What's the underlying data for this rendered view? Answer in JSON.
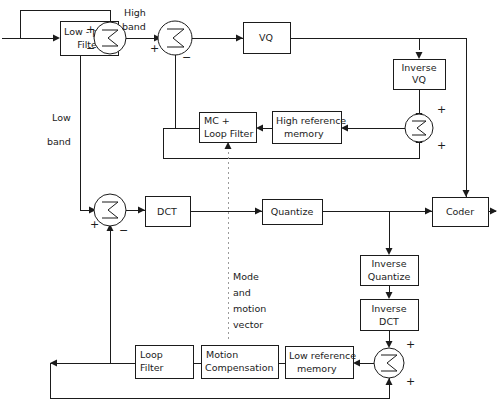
{
  "diagram": {
    "stroke_color": "#1b1b1b",
    "dotted_color": "#9a9a9a",
    "background": "#ffffff",
    "blocks": [
      {
        "id": "low-pass-filter",
        "lines": [
          "Low - pass",
          "Filter"
        ]
      },
      {
        "id": "vq",
        "lines": [
          "VQ"
        ]
      },
      {
        "id": "inverse-vq",
        "lines": [
          "Inverse",
          "VQ"
        ]
      },
      {
        "id": "mc-loop-filter",
        "lines": [
          "MC +",
          "Loop Filter"
        ]
      },
      {
        "id": "high-reference-memory",
        "lines": [
          "High reference",
          "memory"
        ]
      },
      {
        "id": "dct",
        "lines": [
          "DCT"
        ]
      },
      {
        "id": "quantize",
        "lines": [
          "Quantize"
        ]
      },
      {
        "id": "coder",
        "lines": [
          "Coder"
        ]
      },
      {
        "id": "inverse-quantize",
        "lines": [
          "Inverse",
          "Quantize"
        ]
      },
      {
        "id": "inverse-dct",
        "lines": [
          "Inverse",
          "DCT"
        ]
      },
      {
        "id": "low-reference-memory",
        "lines": [
          "Low reference",
          "memory"
        ]
      },
      {
        "id": "motion-compensation",
        "lines": [
          "Motion",
          "Compensation"
        ]
      },
      {
        "id": "loop-filter",
        "lines": [
          "Loop",
          "Filter"
        ]
      }
    ],
    "summers": [
      {
        "id": "summer-high-split",
        "symbol": "Σ",
        "signs": [
          "+",
          "−"
        ]
      },
      {
        "id": "summer-high-residual",
        "symbol": "Σ",
        "signs": [
          "+",
          "−"
        ]
      },
      {
        "id": "summer-high-reconstruct",
        "symbol": "Σ",
        "signs": [
          "+",
          "+"
        ]
      },
      {
        "id": "summer-low-residual",
        "symbol": "Σ",
        "signs": [
          "+",
          "−"
        ]
      },
      {
        "id": "summer-low-reconstruct",
        "symbol": "Σ",
        "signs": [
          "+",
          "+"
        ]
      }
    ],
    "labels": {
      "high_band": [
        "High",
        "band"
      ],
      "low_band": [
        "Low",
        "band"
      ],
      "mode_motion_vector": [
        "Mode",
        "and",
        "motion",
        "vector"
      ]
    },
    "signs": {
      "plus": "+",
      "minus": "−"
    },
    "text": {
      "low_pass_filter_l1": "Low - pass",
      "low_pass_filter_l2": "Filter",
      "vq": "VQ",
      "inverse_vq_l1": "Inverse",
      "inverse_vq_l2": "VQ",
      "mc_loop_filter_l1": "MC +",
      "mc_loop_filter_l2": "Loop Filter",
      "high_ref_mem_l1": "High reference",
      "high_ref_mem_l2": "memory",
      "dct": "DCT",
      "quantize": "Quantize",
      "coder": "Coder",
      "inverse_quantize_l1": "Inverse",
      "inverse_quantize_l2": "Quantize",
      "inverse_dct_l1": "Inverse",
      "inverse_dct_l2": "DCT",
      "low_ref_mem_l1": "Low reference",
      "low_ref_mem_l2": "memory",
      "motion_comp_l1": "Motion",
      "motion_comp_l2": "Compensation",
      "loop_filter_l1": "Loop",
      "loop_filter_l2": "Filter",
      "high_band_l1": "High",
      "high_band_l2": "band",
      "low_band_l1": "Low",
      "low_band_l2": "band",
      "mode_l1": "Mode",
      "mode_l2": "and",
      "mode_l3": "motion",
      "mode_l4": "vector",
      "sigma": "Σ",
      "plus": "+",
      "minus": "−"
    }
  }
}
